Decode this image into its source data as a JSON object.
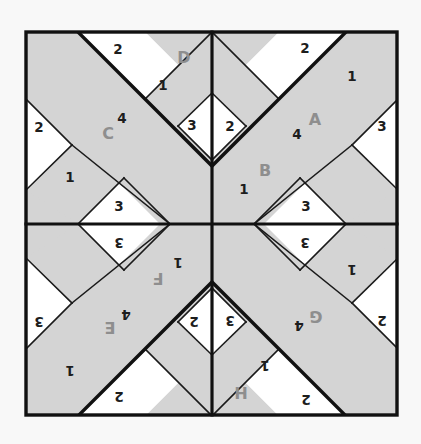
{
  "figure": {
    "kind": "quilt-block-diagram",
    "title": "",
    "width": 421,
    "height": 444,
    "background_color": "#f8f8f8",
    "fabric_gray": "#d4d4d4",
    "fabric_white": "#ffffff",
    "seam_color": "#111111",
    "number_label_color": "#1d1d1d",
    "letter_label_color": "#8e8e8e",
    "frame": {
      "x": 26,
      "y": 32,
      "width": 371,
      "height": 383
    },
    "grid": {
      "columns": 2,
      "rows": 2,
      "center_x": 212,
      "center_y": 224
    }
  },
  "quadrants": [
    {
      "id": "top-left",
      "unit_letters": [
        "C",
        "D"
      ],
      "rotation_deg": 0,
      "labels": [
        {
          "text": "2",
          "type": "number",
          "x": 118,
          "y": 49,
          "rotate": 0
        },
        {
          "text": "D",
          "type": "letter",
          "x": 184,
          "y": 57,
          "rotate": 0
        },
        {
          "text": "1",
          "type": "number",
          "x": 163,
          "y": 85,
          "rotate": 0
        },
        {
          "text": "2",
          "type": "number",
          "x": 39,
          "y": 127,
          "rotate": 0
        },
        {
          "text": "4",
          "type": "number",
          "x": 122,
          "y": 118,
          "rotate": 0
        },
        {
          "text": "C",
          "type": "letter",
          "x": 108,
          "y": 133,
          "rotate": 0
        },
        {
          "text": "3",
          "type": "number",
          "x": 192,
          "y": 125,
          "rotate": 0
        },
        {
          "text": "1",
          "type": "number",
          "x": 70,
          "y": 177,
          "rotate": 0
        },
        {
          "text": "3",
          "type": "number",
          "x": 119,
          "y": 206,
          "rotate": 0
        }
      ]
    },
    {
      "id": "top-right",
      "unit_letters": [
        "A",
        "B"
      ],
      "rotation_deg": 0,
      "mirrored": true,
      "labels": [
        {
          "text": "2",
          "type": "number",
          "x": 305,
          "y": 48,
          "rotate": 0
        },
        {
          "text": "1",
          "type": "number",
          "x": 352,
          "y": 76,
          "rotate": 0
        },
        {
          "text": "2",
          "type": "number",
          "x": 230,
          "y": 126,
          "rotate": 0
        },
        {
          "text": "A",
          "type": "letter",
          "x": 315,
          "y": 119,
          "rotate": 0
        },
        {
          "text": "4",
          "type": "number",
          "x": 297,
          "y": 134,
          "rotate": 0
        },
        {
          "text": "3",
          "type": "number",
          "x": 382,
          "y": 126,
          "rotate": 0
        },
        {
          "text": "B",
          "type": "letter",
          "x": 265,
          "y": 170,
          "rotate": 0
        },
        {
          "text": "1",
          "type": "number",
          "x": 244,
          "y": 189,
          "rotate": 0
        },
        {
          "text": "3",
          "type": "number",
          "x": 306,
          "y": 206,
          "rotate": 0
        }
      ]
    },
    {
      "id": "bottom-left",
      "unit_letters": [
        "E",
        "F"
      ],
      "rotation_deg": 180,
      "labels": [
        {
          "text": "3",
          "type": "number",
          "x": 119,
          "y": 243,
          "rotate": 180
        },
        {
          "text": "1",
          "type": "number",
          "x": 178,
          "y": 263,
          "rotate": 180
        },
        {
          "text": "F",
          "type": "letter",
          "x": 158,
          "y": 278,
          "rotate": 180
        },
        {
          "text": "3",
          "type": "number",
          "x": 39,
          "y": 322,
          "rotate": 180
        },
        {
          "text": "4",
          "type": "number",
          "x": 126,
          "y": 315,
          "rotate": 180
        },
        {
          "text": "E",
          "type": "letter",
          "x": 110,
          "y": 327,
          "rotate": 180
        },
        {
          "text": "2",
          "type": "number",
          "x": 194,
          "y": 322,
          "rotate": 180
        },
        {
          "text": "1",
          "type": "number",
          "x": 70,
          "y": 371,
          "rotate": 180
        },
        {
          "text": "2",
          "type": "number",
          "x": 119,
          "y": 397,
          "rotate": 180
        }
      ]
    },
    {
      "id": "bottom-right",
      "unit_letters": [
        "G",
        "H"
      ],
      "rotation_deg": 180,
      "mirrored": true,
      "labels": [
        {
          "text": "3",
          "type": "number",
          "x": 305,
          "y": 243,
          "rotate": 180
        },
        {
          "text": "1",
          "type": "number",
          "x": 352,
          "y": 270,
          "rotate": 180
        },
        {
          "text": "3",
          "type": "number",
          "x": 230,
          "y": 321,
          "rotate": 180
        },
        {
          "text": "G",
          "type": "letter",
          "x": 316,
          "y": 316,
          "rotate": 180
        },
        {
          "text": "4",
          "type": "number",
          "x": 299,
          "y": 326,
          "rotate": 180
        },
        {
          "text": "2",
          "type": "number",
          "x": 382,
          "y": 321,
          "rotate": 180
        },
        {
          "text": "1",
          "type": "number",
          "x": 265,
          "y": 366,
          "rotate": 180
        },
        {
          "text": "H",
          "type": "letter",
          "x": 241,
          "y": 392,
          "rotate": 180
        },
        {
          "text": "2",
          "type": "number",
          "x": 306,
          "y": 400,
          "rotate": 180
        }
      ]
    }
  ],
  "legend": {
    "gray_meaning": "shaded fabric",
    "white_meaning": "background fabric"
  }
}
